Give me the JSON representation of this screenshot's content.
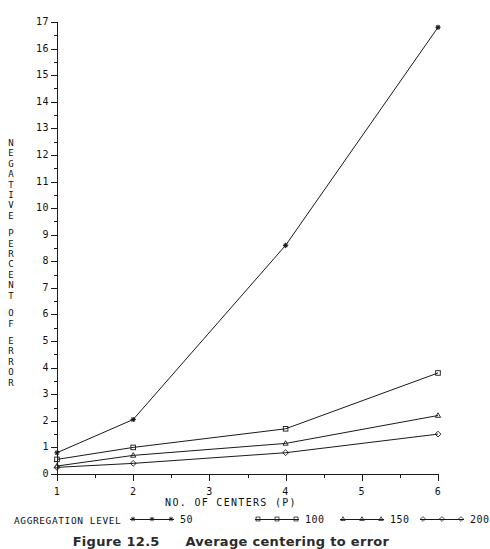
{
  "chart_data": {
    "type": "line",
    "title": "",
    "xlabel": "NO. OF CENTERS (P)",
    "ylabel": "NEGATIVE PERCENT OF ERROR",
    "ylabel_stacked": [
      "N",
      "E",
      "G",
      "A",
      "T",
      "I",
      "V",
      "E",
      "",
      "P",
      "E",
      "R",
      "C",
      "E",
      "N",
      "T",
      "",
      "O",
      "F",
      "",
      "E",
      "R",
      "R",
      "O",
      "R"
    ],
    "x": [
      1,
      2,
      4,
      6
    ],
    "xlim": [
      1,
      6
    ],
    "ylim": [
      0,
      17
    ],
    "xticks": [
      "1",
      "2",
      "3",
      "4",
      "5",
      "6"
    ],
    "yticks": [
      "0",
      "1",
      "2",
      "3",
      "4",
      "5",
      "6",
      "7",
      "8",
      "9",
      "10",
      "11",
      "12",
      "13",
      "14",
      "15",
      "16",
      "17"
    ],
    "grid": false,
    "legend_position": "below-axis",
    "legend_title": "AGGREGATION LEVEL",
    "series": [
      {
        "name": "50",
        "marker": "star",
        "values": [
          0.8,
          2.05,
          8.6,
          16.8
        ]
      },
      {
        "name": "100",
        "marker": "square",
        "values": [
          0.55,
          1.0,
          1.7,
          3.8
        ]
      },
      {
        "name": "150",
        "marker": "triangle",
        "values": [
          0.3,
          0.7,
          1.15,
          2.2
        ]
      },
      {
        "name": "200",
        "marker": "diamond",
        "values": [
          0.25,
          0.4,
          0.8,
          1.5
        ]
      }
    ],
    "line_color": "#1a1a1a"
  },
  "caption": {
    "figure_number": "Figure 12.5",
    "figure_text": "Average centering to error"
  }
}
